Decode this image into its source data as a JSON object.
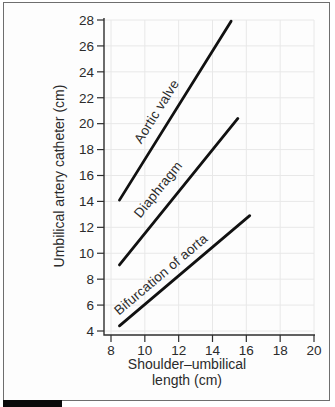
{
  "figure": {
    "border_color": "#6e6e6e",
    "tab_color": "#0a0a0a"
  },
  "chart_data": {
    "type": "line",
    "title": "",
    "ylabel": "Umbilical artery catheter (cm)",
    "xlabel_lines": [
      "Shoulder–umbilical",
      "length (cm)"
    ],
    "xlim": [
      8,
      20
    ],
    "ylim": [
      4,
      28
    ],
    "xticks": [
      8,
      10,
      12,
      14,
      16,
      18,
      20
    ],
    "yticks": [
      4,
      6,
      8,
      10,
      12,
      14,
      16,
      18,
      20,
      22,
      24,
      26,
      28
    ],
    "grid": true,
    "legend_position": "labels-on-lines",
    "line_color": "#111111",
    "grid_color": "#e8e8e8",
    "axis_color": "#2e2e2e",
    "text_color": "#2b2b2b",
    "series": [
      {
        "name": "Aortic valve",
        "x": [
          8.5,
          15.1
        ],
        "y": [
          14.1,
          27.9
        ],
        "label_t": 0.45,
        "label_offset": 11
      },
      {
        "name": "Diaphragm",
        "x": [
          8.5,
          15.5
        ],
        "y": [
          9.1,
          20.4
        ],
        "label_t": 0.44,
        "label_offset": 13
      },
      {
        "name": "Bifurcation of aorta",
        "x": [
          8.5,
          16.2
        ],
        "y": [
          4.4,
          12.9
        ],
        "label_t": 0.38,
        "label_offset": 8
      }
    ]
  }
}
